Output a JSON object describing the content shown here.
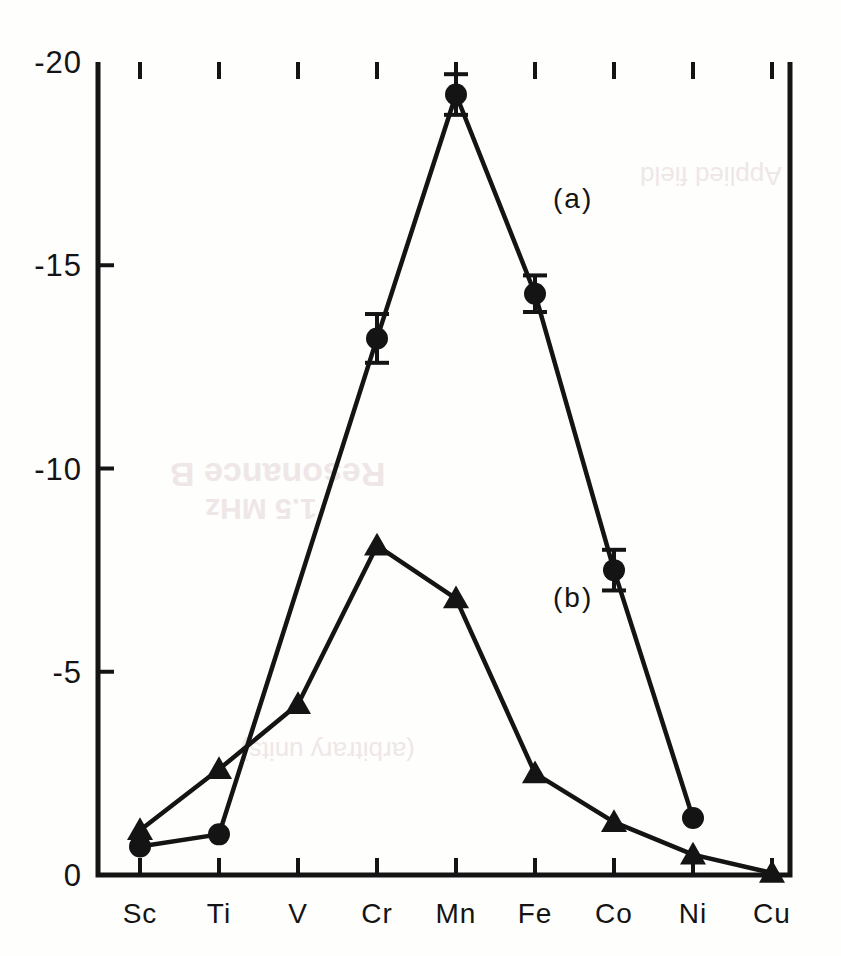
{
  "figure": {
    "background_color": "#fefefc",
    "ink_color": "#141414"
  },
  "chart_data": {
    "type": "line",
    "title": "",
    "xlabel": "",
    "ylabel": "",
    "categories": [
      "Sc",
      "Ti",
      "V",
      "Cr",
      "Mn",
      "Fe",
      "Co",
      "Ni",
      "Cu"
    ],
    "ylim": [
      -20,
      0
    ],
    "yticks": [
      -20,
      -15,
      -10,
      -5,
      0
    ],
    "ytick_labels": [
      "-20",
      "-15",
      "-10",
      "-5",
      "0"
    ],
    "grid": false,
    "legend_position": "inline-annotations",
    "series": [
      {
        "name": "(a)",
        "marker": "filled-circle",
        "has_error_bars": true,
        "x": [
          "Sc",
          "Ti",
          "Cr",
          "Mn",
          "Fe",
          "Co",
          "Ni"
        ],
        "values": [
          -0.7,
          -1.0,
          -13.2,
          -19.2,
          -14.3,
          -7.5,
          -1.4
        ],
        "errors": [
          0.0,
          0.0,
          0.6,
          0.5,
          0.45,
          0.5,
          0.0
        ]
      },
      {
        "name": "(b)",
        "marker": "filled-triangle",
        "has_error_bars": false,
        "x": [
          "Sc",
          "Ti",
          "V",
          "Cr",
          "Mn",
          "Fe",
          "Co",
          "Ni",
          "Cu"
        ],
        "values": [
          -1.1,
          -2.6,
          -4.2,
          -8.1,
          -6.8,
          -2.5,
          -1.3,
          -0.5,
          -0.05
        ]
      }
    ],
    "annotations": [
      {
        "text": "(a)",
        "x_category": "Fe",
        "y_value": -16.4
      },
      {
        "text": "(b)",
        "x_category": "Fe",
        "y_value": -6.6
      }
    ]
  },
  "ghost_text": {
    "line1": "Resonance B",
    "line2": "1.5 MHz",
    "line3": "(arbitrary units)",
    "line4": "Applied field"
  }
}
